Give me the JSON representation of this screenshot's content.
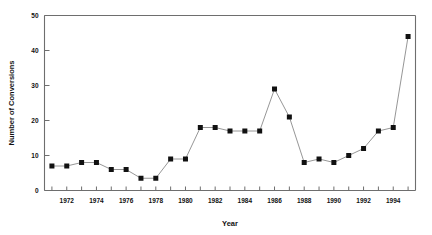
{
  "chart_data": {
    "type": "line",
    "title": "",
    "xlabel": "Year",
    "ylabel": "Number of Conversions",
    "xlim": [
      1970.5,
      1995.5
    ],
    "ylim": [
      0,
      50
    ],
    "ytick_labels": [
      "0",
      "10",
      "20",
      "30",
      "40",
      "50"
    ],
    "yticks": [
      0,
      10,
      20,
      30,
      40,
      50
    ],
    "xtick_labels": [
      "1972",
      "1974",
      "1976",
      "1978",
      "1980",
      "1982",
      "1984",
      "1986",
      "1988",
      "1990",
      "1992",
      "1994"
    ],
    "xticks_major": [
      1972,
      1974,
      1976,
      1978,
      1980,
      1982,
      1984,
      1986,
      1988,
      1990,
      1992,
      1994
    ],
    "xticks_all": [
      1971,
      1972,
      1973,
      1974,
      1975,
      1976,
      1977,
      1978,
      1979,
      1980,
      1981,
      1982,
      1983,
      1984,
      1985,
      1986,
      1987,
      1988,
      1989,
      1990,
      1991,
      1992,
      1993,
      1994,
      1995
    ],
    "grid": false,
    "legend": null,
    "marker": "square",
    "marker_color": "#111111",
    "line_color": "#8a8a8a",
    "x": [
      1971,
      1972,
      1973,
      1974,
      1975,
      1976,
      1977,
      1978,
      1979,
      1980,
      1981,
      1982,
      1983,
      1984,
      1985,
      1986,
      1987,
      1988,
      1989,
      1990,
      1991,
      1992,
      1993,
      1994
    ],
    "values": [
      7,
      7,
      8,
      8,
      6,
      6,
      3.5,
      3.5,
      9,
      9,
      18,
      18,
      17,
      17,
      17,
      29,
      21,
      8,
      9,
      8,
      10,
      12,
      17,
      18
    ],
    "series": [
      {
        "name": "Number of Conversions",
        "values": [
          7,
          7,
          8,
          8,
          6,
          6,
          3.5,
          3.5,
          9,
          9,
          18,
          18,
          17,
          17,
          17,
          29,
          21,
          8,
          9,
          8,
          10,
          12,
          17,
          18
        ]
      }
    ],
    "final_point": {
      "x": 1995,
      "y": 44
    }
  },
  "axes": {
    "y_title": "Number of Conversions",
    "x_title": "Year"
  }
}
